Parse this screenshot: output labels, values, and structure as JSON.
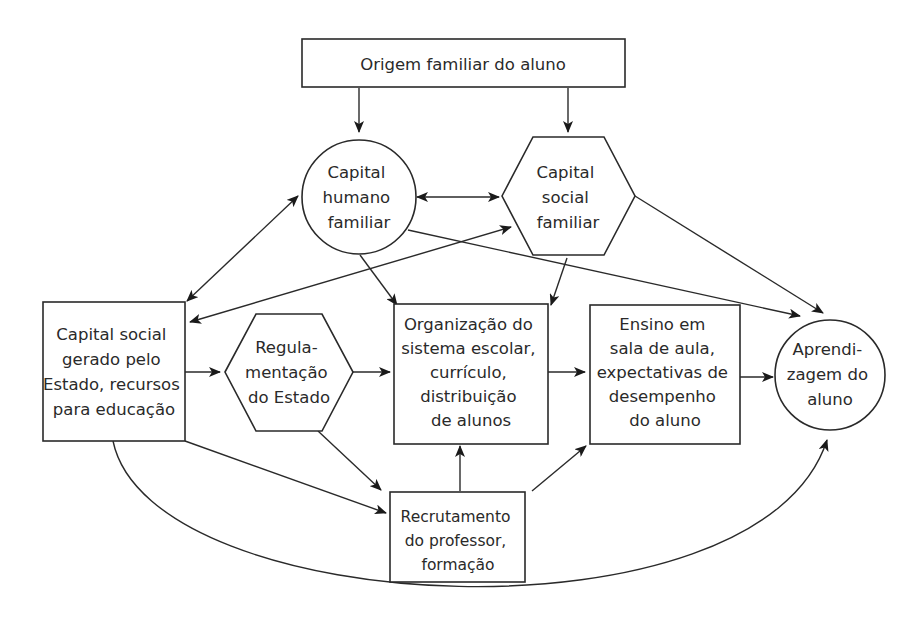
{
  "diagram": {
    "nodes": {
      "origem": {
        "shape": "rectangle",
        "lines": [
          "Origem familiar do aluno"
        ]
      },
      "capital_humano": {
        "shape": "circle",
        "lines": [
          "Capital",
          "humano",
          "familiar"
        ]
      },
      "capital_social_familiar": {
        "shape": "hexagon",
        "lines": [
          "Capital",
          "social",
          "familiar"
        ]
      },
      "capital_social_estado": {
        "shape": "rectangle",
        "lines": [
          "Capital social",
          "gerado pelo",
          "Estado, recursos",
          "para educação"
        ]
      },
      "regulamentacao": {
        "shape": "hexagon",
        "lines": [
          "Regula-",
          "mentação",
          "do Estado"
        ]
      },
      "organizacao": {
        "shape": "rectangle",
        "lines": [
          "Organização do",
          "sistema escolar,",
          "currículo,",
          "distribuição",
          "de alunos"
        ]
      },
      "ensino": {
        "shape": "rectangle",
        "lines": [
          "Ensino em",
          "sala de aula,",
          "expectativas de",
          "desempenho",
          "do aluno"
        ]
      },
      "aprendizagem": {
        "shape": "circle",
        "lines": [
          "Aprendi-",
          "zagem do",
          "aluno"
        ]
      },
      "recrutamento": {
        "shape": "rectangle",
        "lines": [
          "Recrutamento",
          "do professor,",
          "formação"
        ]
      }
    },
    "edges": [
      {
        "from": "origem",
        "to": "capital_humano"
      },
      {
        "from": "origem",
        "to": "capital_social_familiar"
      },
      {
        "from": "capital_humano",
        "to": "capital_social_familiar",
        "bidirectional": true
      },
      {
        "from": "capital_humano",
        "to": "capital_social_estado",
        "bidirectional": true
      },
      {
        "from": "capital_social_estado",
        "to": "capital_social_familiar",
        "bidirectional": true
      },
      {
        "from": "capital_humano",
        "to": "organizacao"
      },
      {
        "from": "capital_humano",
        "to": "aprendizagem"
      },
      {
        "from": "capital_social_familiar",
        "to": "organizacao"
      },
      {
        "from": "capital_social_familiar",
        "to": "aprendizagem"
      },
      {
        "from": "capital_social_estado",
        "to": "regulamentacao"
      },
      {
        "from": "capital_social_estado",
        "to": "recrutamento"
      },
      {
        "from": "capital_social_estado",
        "to": "aprendizagem",
        "curved": true
      },
      {
        "from": "regulamentacao",
        "to": "organizacao"
      },
      {
        "from": "regulamentacao",
        "to": "recrutamento"
      },
      {
        "from": "organizacao",
        "to": "ensino"
      },
      {
        "from": "ensino",
        "to": "aprendizagem"
      },
      {
        "from": "recrutamento",
        "to": "organizacao"
      },
      {
        "from": "recrutamento",
        "to": "ensino"
      }
    ]
  }
}
